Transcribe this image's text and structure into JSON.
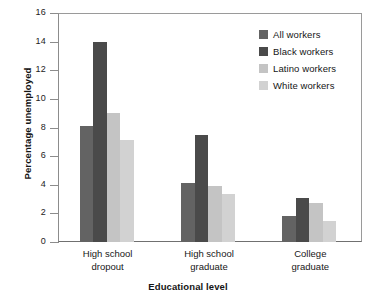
{
  "chart_data": {
    "type": "bar",
    "title": "",
    "subtitle": "",
    "xlabel": "Educational level",
    "ylabel": "Percentage unemployed",
    "categories": [
      "High school\ndropout",
      "High school\ngraduate",
      "College\ngraduate"
    ],
    "series": [
      {
        "name": "All workers",
        "color": "#636363",
        "values": [
          8.1,
          4.15,
          1.8
        ]
      },
      {
        "name": "Black workers",
        "color": "#4a4a4a",
        "values": [
          14.0,
          7.5,
          3.1
        ]
      },
      {
        "name": "Latino workers",
        "color": "#c4c4c4",
        "values": [
          9.0,
          3.9,
          2.75
        ]
      },
      {
        "name": "White workers",
        "color": "#d2d2d2",
        "values": [
          7.1,
          3.35,
          1.5
        ]
      }
    ],
    "ylim": [
      0,
      16
    ],
    "yticks": [
      0,
      2,
      4,
      6,
      8,
      10,
      12,
      14,
      16
    ],
    "ytick_labels": [
      "0",
      "2",
      "4",
      "6",
      "8",
      "10",
      "12",
      "14",
      "16"
    ],
    "grid": false,
    "legend_position": "top-right",
    "legend_entries": [
      "All workers",
      "Black workers",
      "Latino workers",
      "White workers"
    ]
  },
  "axes": {
    "y_title": "Percentage unemployed",
    "x_title": "Educational level"
  }
}
